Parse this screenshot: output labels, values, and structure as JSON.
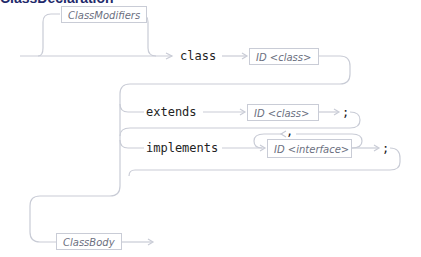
{
  "title": "ClassDeclaration",
  "nonterminals": {
    "class_modifiers": "ClassModifiers",
    "id_class_1": "ID <class>",
    "id_class_2": "ID <class>",
    "id_interface": "ID <interface>",
    "class_body": "ClassBody"
  },
  "keywords": {
    "class": "class",
    "extends": "extends",
    "implements": "implements",
    "semicolon_1": ";",
    "semicolon_2": ";",
    "comma": ","
  },
  "colors": {
    "rail": "#c9ccd6",
    "title": "#1f2a6b",
    "text": "#222222"
  }
}
